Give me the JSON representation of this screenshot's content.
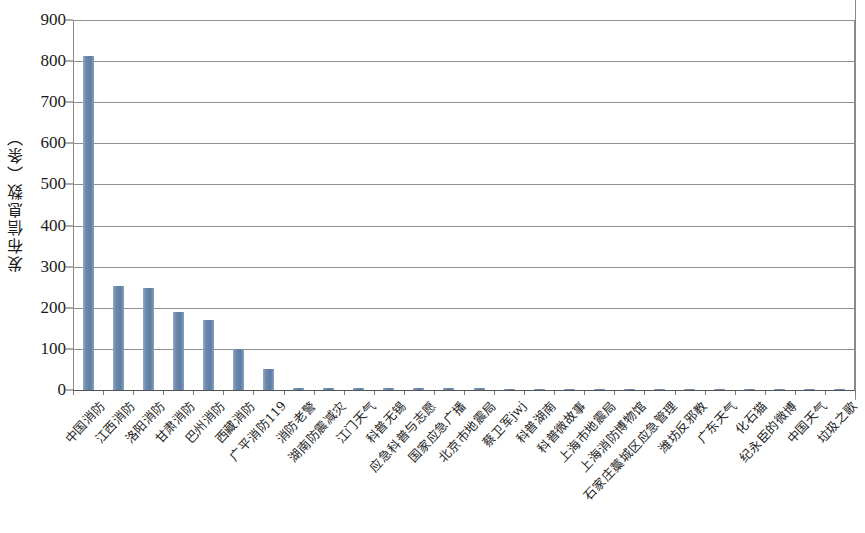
{
  "chart_data": {
    "type": "bar",
    "title": "",
    "xlabel": "",
    "ylabel": "发布信息数（条）",
    "ylim": [
      0,
      900
    ],
    "ytick_step": 100,
    "grid": true,
    "legend": "none",
    "bar_color": "#6b87ab",
    "categories": [
      "中国消防",
      "江西消防",
      "洛阳消防",
      "甘肃消防",
      "巴州消防",
      "西藏消防",
      "广平消防119",
      "消防老警",
      "湖南防震减灾",
      "江门天气",
      "科普无锡",
      "应急科普与志愿",
      "国家应急广播",
      "北京市地震局",
      "蔡卫军jwj",
      "科普湖南",
      "科普微故事",
      "上海市地震局",
      "上海消防博物馆",
      "石家庄藁城区应急管理",
      "潍坊反邪教",
      "广东天气",
      "化石猫",
      "纪永臣的微博",
      "中国天气",
      "垃圾之歌"
    ],
    "values": [
      812,
      252,
      248,
      190,
      170,
      100,
      50,
      6,
      5,
      5,
      4,
      4,
      4,
      4,
      3,
      3,
      3,
      3,
      3,
      3,
      2,
      2,
      2,
      2,
      2,
      2
    ],
    "ytick_labels": [
      "900",
      "800",
      "700",
      "600",
      "500",
      "400",
      "300",
      "200",
      "100",
      "0"
    ],
    "ytick_values": [
      900,
      800,
      700,
      600,
      500,
      400,
      300,
      200,
      100,
      0
    ]
  }
}
